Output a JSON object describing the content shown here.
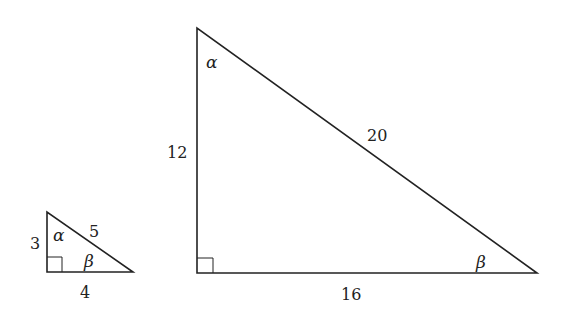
{
  "diagram": {
    "small_triangle": {
      "vertical_leg": "3",
      "horizontal_leg": "4",
      "hypotenuse": "5",
      "top_angle": "α",
      "right_angle_label": "β",
      "right_angle_marker": true
    },
    "large_triangle": {
      "vertical_leg": "12",
      "horizontal_leg": "16",
      "hypotenuse": "20",
      "top_angle": "α",
      "right_angle_label": "β",
      "right_angle_marker": true
    },
    "colors": {
      "stroke": "#222222",
      "background": "#ffffff"
    }
  }
}
